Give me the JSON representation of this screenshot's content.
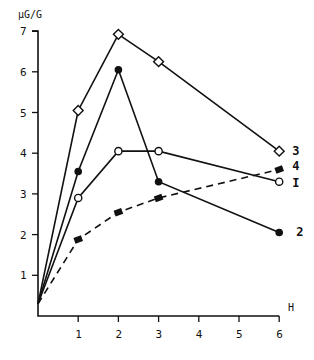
{
  "chart_data": {
    "type": "line",
    "title": "",
    "xlabel": "H",
    "ylabel": "μG/G",
    "xlim": [
      0,
      6
    ],
    "ylim": [
      0,
      7
    ],
    "x_ticks": [
      1,
      2,
      3,
      4,
      5,
      6
    ],
    "y_ticks": [
      1,
      2,
      3,
      4,
      5,
      6,
      7
    ],
    "grid": false,
    "legend_position": "inline-right",
    "series": [
      {
        "name": "3",
        "marker": "open-diamond",
        "style": "solid",
        "x": [
          0,
          1,
          2,
          3,
          6
        ],
        "values": [
          0.3,
          5.05,
          6.92,
          6.25,
          4.05
        ]
      },
      {
        "name": "2",
        "marker": "filled-circle",
        "style": "solid",
        "x": [
          0,
          1,
          2,
          3,
          6
        ],
        "values": [
          0.3,
          3.55,
          6.05,
          3.3,
          2.05
        ]
      },
      {
        "name": "I",
        "marker": "open-circle",
        "style": "solid",
        "x": [
          0,
          1,
          2,
          3,
          6
        ],
        "values": [
          0.3,
          2.9,
          4.05,
          4.05,
          3.3
        ]
      },
      {
        "name": "4",
        "marker": "filled-square",
        "style": "dashed",
        "x": [
          0,
          1,
          2,
          3,
          6
        ],
        "values": [
          0.3,
          1.88,
          2.55,
          2.9,
          3.6
        ]
      }
    ]
  },
  "labels": {
    "y_unit": "μG/G",
    "x_unit": "H"
  }
}
